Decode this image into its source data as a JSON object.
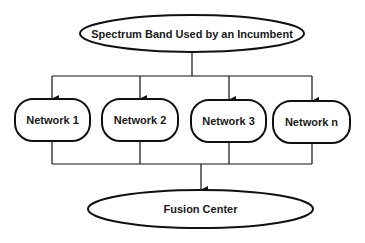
{
  "diagram": {
    "type": "flowchart",
    "source_node": {
      "label": "Spectrum Band Used by an Incumbent",
      "shape": "ellipse"
    },
    "networks": [
      {
        "label": "Network 1",
        "shape": "rounded-rect"
      },
      {
        "label": "Network 2",
        "shape": "rounded-rect"
      },
      {
        "label": "Network 3",
        "shape": "rounded-rect"
      },
      {
        "label": "Network n",
        "shape": "rounded-rect"
      }
    ],
    "sink_node": {
      "label": "Fusion Center",
      "shape": "ellipse"
    },
    "edges": [
      {
        "from": "Spectrum Band Used by an Incumbent",
        "to": "Network 1"
      },
      {
        "from": "Spectrum Band Used by an Incumbent",
        "to": "Network 2"
      },
      {
        "from": "Spectrum Band Used by an Incumbent",
        "to": "Network 3"
      },
      {
        "from": "Spectrum Band Used by an Incumbent",
        "to": "Network n"
      },
      {
        "from": "Network 1",
        "to": "Fusion Center"
      },
      {
        "from": "Network 2",
        "to": "Fusion Center"
      },
      {
        "from": "Network 3",
        "to": "Fusion Center"
      },
      {
        "from": "Network n",
        "to": "Fusion Center"
      }
    ],
    "colors": {
      "stroke": "#111111",
      "text": "#1a1a1a",
      "background": "#ffffff"
    }
  }
}
